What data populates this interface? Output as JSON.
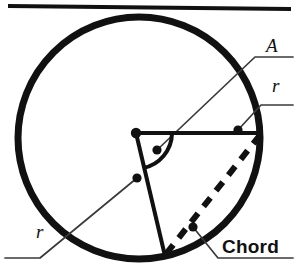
{
  "figure": {
    "colors": {
      "stroke": "#111111",
      "background": "#ffffff",
      "leader": "#3a3a3a"
    },
    "top_rule": {
      "name": "top-horizontal-rule",
      "x1": 8,
      "y1": 6,
      "x2": 291,
      "y2": 9,
      "width": 4
    },
    "circle": {
      "name": "circle-outline",
      "cx": 139,
      "cy": 138,
      "r": 121,
      "stroke_width": 7
    },
    "center_point": {
      "name": "circle-center-dot",
      "cx": 136,
      "cy": 133,
      "r": 5
    },
    "radius_horizontal": {
      "name": "radius-horizontal",
      "x1": 136,
      "y1": 133,
      "x2": 260,
      "y2": 133,
      "width": 4
    },
    "radius_lower": {
      "name": "radius-lower",
      "x1": 136,
      "y1": 133,
      "x2": 165,
      "y2": 256,
      "width": 4
    },
    "angle_arc": {
      "name": "central-angle-arc",
      "path": "M 172 133 A 36 36 0 0 1 143 168",
      "width": 4
    },
    "chord": {
      "name": "chord-dashed-line",
      "x1": 260,
      "y1": 135,
      "x2": 166,
      "y2": 254,
      "width": 6,
      "dash": "11 9"
    },
    "leaders": [
      {
        "name": "leader-angle-A",
        "dot": {
          "cx": 157,
          "cy": 150,
          "r": 4.5
        },
        "path": "M 157 150 L 255 57 L 293 57"
      },
      {
        "name": "leader-radius-right",
        "dot": {
          "cx": 238,
          "cy": 130,
          "r": 4.5
        },
        "path": "M 238 130 L 261 105 L 293 105"
      },
      {
        "name": "leader-radius-left",
        "dot": {
          "cx": 137,
          "cy": 178,
          "r": 4.5
        },
        "path": "M 137 178 L 40 258 L 5 258"
      },
      {
        "name": "leader-chord",
        "dot": {
          "cx": 193,
          "cy": 227,
          "r": 4.5
        },
        "path": "M 193 227 L 218 258 L 293 258"
      }
    ]
  },
  "labels": {
    "angle": "A",
    "radius_right": "r",
    "radius_left": "r",
    "chord": "Chord"
  }
}
